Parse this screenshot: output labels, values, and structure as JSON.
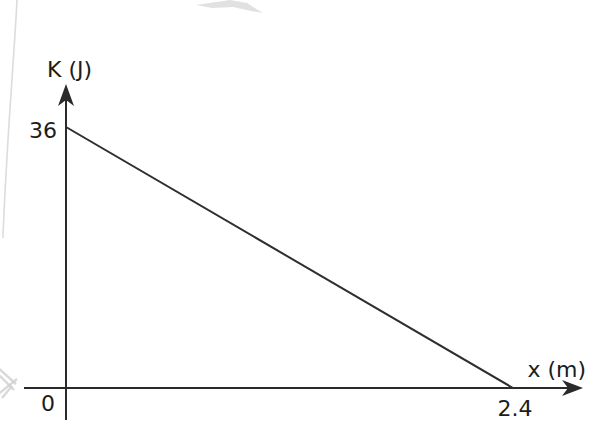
{
  "chart_data": {
    "type": "line",
    "title": "",
    "xlabel": "x (m)",
    "ylabel": "K (J)",
    "x": [
      0,
      2.4
    ],
    "y": [
      36,
      0
    ],
    "xlim": [
      0,
      2.4
    ],
    "ylim": [
      0,
      36
    ],
    "x_tick_labels": [
      "2.4"
    ],
    "y_tick_labels": [
      "36"
    ],
    "origin_label": "0",
    "grid": false,
    "legend": false,
    "line_color": "#2e2e2e"
  },
  "colors": {
    "ink": "#2a2a2a",
    "text": "#1c1c1c",
    "background": "#ffffff",
    "scan_artifact": "#d6d6d6"
  }
}
